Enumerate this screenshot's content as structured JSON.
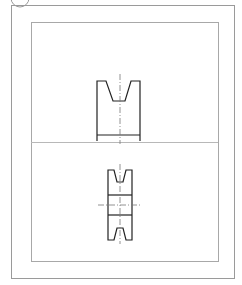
{
  "header": {
    "title": "",
    "icon": "circle-icon"
  },
  "sheet": {
    "outer_frame": {
      "x": 11,
      "y": 5,
      "w": 223,
      "h": 273,
      "color": "#9a9a9a"
    },
    "inner_frame": {
      "x": 31,
      "y": 22,
      "w": 187,
      "h": 239,
      "color": "#a8a8a8"
    },
    "divider_y": 142,
    "divider_color": "#b8b8b8"
  },
  "views": [
    {
      "name": "front-view",
      "label": "V-belt pulley front view"
    },
    {
      "name": "side-view",
      "label": "V-belt pulley side section view"
    }
  ],
  "colors": {
    "object_line": "#222222",
    "center_line": "#777777",
    "background": "#ffffff"
  }
}
